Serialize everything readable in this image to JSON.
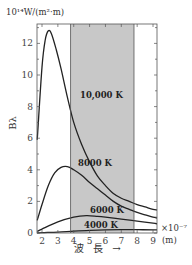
{
  "chart_data": {
    "type": "line",
    "title": "",
    "ylabel": "Bλ",
    "yunit": "10¹⁴W/(m²·m)",
    "xlabel": "波 長 →",
    "xunit": "(m)",
    "xscale_note": "×10⁻⁷",
    "xlim": [
      1.7,
      9.3
    ],
    "ylim": [
      0,
      13.5
    ],
    "xticks": [
      2,
      3,
      4,
      5,
      6,
      7,
      8,
      9
    ],
    "yticks": [
      0,
      2,
      4,
      6,
      8,
      10,
      12
    ],
    "grid": false,
    "shaded_region": {
      "x_start": 3.8,
      "x_end": 7.8,
      "color": "#c8c8c8",
      "meaning": "visible light band"
    },
    "series": [
      {
        "name": "10,000 K",
        "x": [
          1.7,
          2.0,
          2.2,
          2.4,
          2.6,
          2.9,
          3.2,
          3.6,
          4.0,
          4.5,
          5.0,
          5.5,
          6.0,
          6.5,
          7.0,
          7.5,
          8.0,
          8.5,
          9.0,
          9.3
        ],
        "values": [
          5.9,
          10.5,
          12.2,
          12.8,
          12.6,
          11.6,
          10.4,
          8.6,
          7.0,
          5.6,
          4.5,
          3.6,
          3.0,
          2.5,
          2.2,
          2.0,
          1.8,
          1.65,
          1.5,
          1.45
        ]
      },
      {
        "name": "8000 K",
        "x": [
          1.7,
          2.0,
          2.4,
          2.8,
          3.2,
          3.6,
          4.0,
          4.5,
          5.0,
          5.5,
          6.0,
          6.5,
          7.0,
          7.5,
          8.0,
          8.5,
          9.0,
          9.3
        ],
        "values": [
          0.8,
          1.8,
          3.0,
          3.8,
          4.15,
          4.2,
          4.0,
          3.65,
          3.2,
          2.8,
          2.4,
          2.0,
          1.7,
          1.5,
          1.3,
          1.15,
          1.0,
          0.95
        ]
      },
      {
        "name": "6000 K",
        "x": [
          1.7,
          2.0,
          3.0,
          4.0,
          4.8,
          5.5,
          6.0,
          7.0,
          8.0,
          9.0,
          9.3
        ],
        "values": [
          0.1,
          0.25,
          0.7,
          1.0,
          1.1,
          1.05,
          1.0,
          0.88,
          0.75,
          0.62,
          0.58
        ]
      },
      {
        "name": "4000 K",
        "x": [
          1.7,
          2.0,
          3.0,
          4.0,
          5.0,
          6.0,
          7.0,
          8.0,
          9.0,
          9.3
        ],
        "values": [
          0.0,
          0.02,
          0.06,
          0.12,
          0.17,
          0.2,
          0.21,
          0.21,
          0.2,
          0.2
        ]
      }
    ],
    "annotations": [
      {
        "text": "10,000 K",
        "x": 6.0,
        "y": 8.9
      },
      {
        "text": "8000 K",
        "x": 4.9,
        "y": 4.3
      },
      {
        "text": "6000 K",
        "x": 6.7,
        "y": 1.3
      },
      {
        "text": "4000 K",
        "x": 6.0,
        "y": 0.35
      }
    ]
  },
  "labels": {
    "yunit": "10¹⁴W/(m²·m)",
    "ylabel": "Bλ",
    "xtitle": "波 長 →",
    "xunit": "(m)",
    "xexp": "×10⁻⁷"
  }
}
